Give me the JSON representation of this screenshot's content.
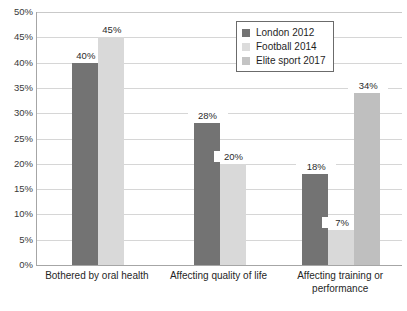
{
  "chart_data": {
    "type": "bar",
    "title": "",
    "subtitle": "",
    "xlabel": "",
    "ylabel": "",
    "ylim": [
      0,
      50
    ],
    "y_tick_labels": [
      "50%",
      "45%",
      "40%",
      "35%",
      "30%",
      "25%",
      "20%",
      "15%",
      "10%",
      "5%",
      "0%"
    ],
    "y_ticks": [
      50,
      45,
      40,
      35,
      30,
      25,
      20,
      15,
      10,
      5,
      0
    ],
    "grid": true,
    "legend_position": "top-right",
    "categories": [
      "Bothered by oral health",
      "Affecting quality of life",
      "Affecting training or performance"
    ],
    "category_lines": [
      [
        "Bothered by oral health"
      ],
      [
        "Affecting quality of life"
      ],
      [
        "Affecting training or",
        "performance"
      ]
    ],
    "series": [
      {
        "name": "London 2012",
        "color": "#737373",
        "values": [
          40,
          28,
          18
        ],
        "labels": [
          "40%",
          "28%",
          "18%"
        ]
      },
      {
        "name": "Football 2014",
        "color": "#d9d9d9",
        "values": [
          45,
          20,
          7
        ],
        "labels": [
          "45%",
          "20%",
          "7%"
        ]
      },
      {
        "name": "Elite sport 2017",
        "color": "#bfbfbf",
        "values": [
          null,
          null,
          34
        ],
        "labels": [
          "",
          "",
          "34%"
        ]
      }
    ]
  },
  "legend": {
    "items": [
      {
        "label": "London 2012",
        "color": "#737373"
      },
      {
        "label": "Football 2014",
        "color": "#dcdcdc"
      },
      {
        "label": "Elite sport 2017",
        "color": "#c4c4c4"
      }
    ]
  }
}
